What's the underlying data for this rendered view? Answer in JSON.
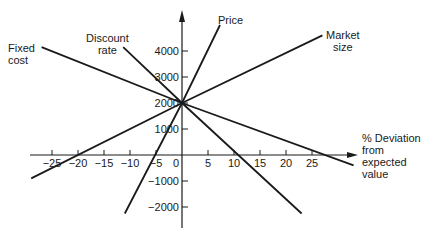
{
  "chart_data": {
    "type": "line",
    "title": "",
    "xlabel": "% Deviation from expected value",
    "ylabel": "",
    "xlim": [
      -27,
      33
    ],
    "ylim": [
      -2500,
      5500
    ],
    "grid": false,
    "x_ticks": [
      -25,
      -20,
      -15,
      -10,
      -5,
      0,
      5,
      10,
      15,
      20,
      25
    ],
    "y_ticks": [
      -2000,
      -1000,
      1000,
      2000,
      3000,
      4000
    ],
    "origin_label": "0",
    "pivot_point": {
      "x": 0,
      "y": 2000
    },
    "series": [
      {
        "name": "Fixed cost",
        "points": [
          [
            -27,
            4150
          ],
          [
            0,
            2000
          ],
          [
            33,
            -400
          ]
        ],
        "x_intercept": 25.5
      },
      {
        "name": "Discount rate",
        "points": [
          [
            -11.3,
            4150
          ],
          [
            0,
            2000
          ],
          [
            23,
            -2250
          ]
        ],
        "x_intercept": 10.5
      },
      {
        "name": "Price",
        "points": [
          [
            7.3,
            5000
          ],
          [
            0,
            2000
          ],
          [
            -11,
            -2250
          ]
        ],
        "x_intercept": -5
      },
      {
        "name": "Market size",
        "points": [
          [
            27,
            4600
          ],
          [
            0,
            2000
          ],
          [
            -29,
            -900
          ]
        ],
        "x_intercept": -20
      }
    ]
  },
  "labels": {
    "fixed_cost": [
      "Fixed",
      "cost"
    ],
    "discount_rate": [
      "Discount",
      "rate"
    ],
    "price": "Price",
    "market_size": [
      "Market",
      "size"
    ],
    "x_axis_title": [
      "% Deviation",
      "from",
      "expected",
      "value"
    ]
  },
  "style": {
    "line_color": "#1a1a1a",
    "axis_color": "#1a1a1a",
    "background": "#ffffff"
  }
}
